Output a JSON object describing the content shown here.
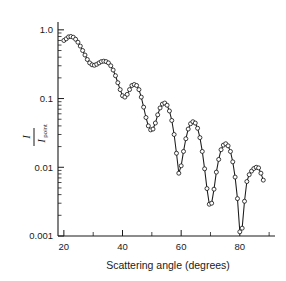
{
  "figure": {
    "background_color": "#ffffff",
    "ink_color": "#1a1a1a"
  },
  "axes": {
    "x": {
      "title": "Scattering angle (degrees)",
      "major_ticks": [
        20,
        40,
        60,
        80
      ],
      "major_tick_labels": [
        "20",
        "40",
        "60",
        "80"
      ],
      "minor_ticks": [
        30,
        50,
        70,
        90
      ],
      "range": [
        18,
        92
      ]
    },
    "y": {
      "numerator": "I",
      "denominator": "I",
      "denominator_subscript": "point",
      "scale": "log",
      "major_ticks": [
        1.0,
        0.1,
        0.01,
        0.001
      ],
      "major_tick_labels": [
        "1.0",
        "0.1",
        "0.01",
        "0.001"
      ],
      "range": [
        0.001,
        1.3
      ]
    }
  },
  "chart_data": {
    "type": "line",
    "title": "",
    "xlabel": "Scattering angle (degrees)",
    "ylabel": "I / I_point",
    "yscale": "log",
    "xlim": [
      18,
      92
    ],
    "ylim": [
      0.001,
      1.3
    ],
    "grid": false,
    "legend": "none",
    "marker": "open-circle",
    "series": [
      {
        "name": "scattered intensity ratio",
        "x": [
          20.0,
          20.8,
          21.6,
          22.4,
          23.2,
          24.0,
          24.8,
          25.6,
          26.4,
          27.2,
          28.0,
          28.8,
          29.6,
          30.4,
          31.2,
          32.0,
          32.8,
          33.6,
          34.4,
          35.2,
          36.0,
          36.8,
          37.6,
          38.4,
          39.2,
          40.0,
          40.8,
          41.6,
          42.4,
          43.2,
          44.0,
          44.8,
          45.6,
          46.4,
          47.2,
          48.0,
          48.8,
          49.6,
          50.4,
          51.2,
          52.0,
          52.8,
          53.6,
          54.4,
          55.2,
          56.0,
          56.8,
          57.6,
          58.4,
          59.2,
          60.0,
          60.8,
          61.6,
          62.4,
          63.2,
          64.0,
          64.8,
          65.6,
          66.4,
          67.2,
          68.0,
          68.8,
          69.6,
          70.4,
          71.2,
          72.0,
          72.8,
          73.6,
          74.4,
          75.2,
          76.0,
          76.8,
          77.6,
          78.4,
          79.2,
          80.0,
          80.8,
          81.6,
          82.4,
          83.2,
          84.0,
          84.8,
          85.6,
          86.4,
          87.2,
          88.0
        ],
        "y": [
          0.7,
          0.74,
          0.79,
          0.8,
          0.78,
          0.73,
          0.66,
          0.58,
          0.5,
          0.43,
          0.37,
          0.33,
          0.31,
          0.305,
          0.315,
          0.33,
          0.345,
          0.35,
          0.345,
          0.33,
          0.3,
          0.26,
          0.215,
          0.17,
          0.135,
          0.11,
          0.105,
          0.115,
          0.135,
          0.155,
          0.16,
          0.155,
          0.135,
          0.105,
          0.075,
          0.053,
          0.04,
          0.035,
          0.036,
          0.044,
          0.058,
          0.073,
          0.083,
          0.086,
          0.08,
          0.066,
          0.048,
          0.03,
          0.016,
          0.0082,
          0.0105,
          0.017,
          0.026,
          0.036,
          0.043,
          0.046,
          0.044,
          0.037,
          0.027,
          0.017,
          0.0095,
          0.0049,
          0.0029,
          0.003,
          0.0048,
          0.0085,
          0.013,
          0.018,
          0.021,
          0.022,
          0.0205,
          0.017,
          0.012,
          0.0072,
          0.0035,
          0.00115,
          0.0013,
          0.0032,
          0.0062,
          0.0078,
          0.0088,
          0.0096,
          0.01,
          0.0098,
          0.0082,
          0.0065
        ]
      }
    ]
  }
}
